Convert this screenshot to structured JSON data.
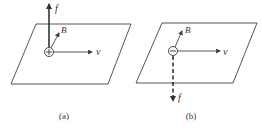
{
  "colors": {
    "line": "#555555",
    "arrow": "#333333",
    "background": "#ffffff"
  },
  "panels": [
    {
      "id": "a",
      "caption": "(a)",
      "charge_sign": "+",
      "charge_icon": "positive-charge-icon",
      "labels": {
        "force": "f",
        "field": "B",
        "velocity": "v"
      },
      "force_direction": "up",
      "force_style": "solid"
    },
    {
      "id": "b",
      "caption": "(b)",
      "charge_sign": "−",
      "charge_icon": "negative-charge-icon",
      "labels": {
        "force": "f",
        "field": "B",
        "velocity": "v"
      },
      "force_direction": "down",
      "force_style": "dashed"
    }
  ]
}
